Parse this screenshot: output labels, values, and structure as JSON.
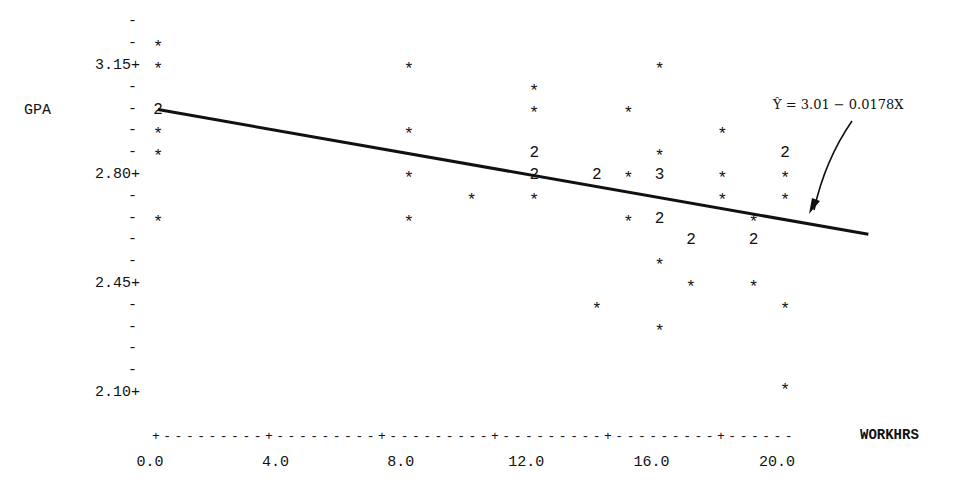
{
  "chart_data": {
    "type": "scatter",
    "title": "",
    "xlabel": "WORKHRS",
    "ylabel": "GPA",
    "x_ticks": [
      "0.0",
      "4.0",
      "8.0",
      "12.0",
      "16.0",
      "20.0"
    ],
    "y_ticks": [
      "3.15+",
      "2.80+",
      "2.45+",
      "2.10+"
    ],
    "xlim": [
      0,
      22.5
    ],
    "ylim": [
      2.03,
      3.29
    ],
    "grid": false,
    "legend": null,
    "marker_note": "* = 1 observation, digit = number of coincident observations",
    "regression_line": {
      "label": "Ŷ = 3.01 − 0.0178X",
      "intercept": 3.01,
      "slope": -0.0178,
      "x_range": [
        0,
        22.5
      ]
    },
    "points": [
      {
        "x": 0,
        "y": 3.22,
        "count": 1,
        "mark": "*"
      },
      {
        "x": 0,
        "y": 3.15,
        "count": 1,
        "mark": "*"
      },
      {
        "x": 0,
        "y": 3.01,
        "count": 2,
        "mark": "2"
      },
      {
        "x": 0,
        "y": 2.94,
        "count": 1,
        "mark": "*"
      },
      {
        "x": 0,
        "y": 2.87,
        "count": 1,
        "mark": "*"
      },
      {
        "x": 0,
        "y": 2.66,
        "count": 1,
        "mark": "*"
      },
      {
        "x": 8,
        "y": 3.15,
        "count": 1,
        "mark": "*"
      },
      {
        "x": 8,
        "y": 2.94,
        "count": 1,
        "mark": "*"
      },
      {
        "x": 8,
        "y": 2.8,
        "count": 1,
        "mark": "*"
      },
      {
        "x": 8,
        "y": 2.66,
        "count": 1,
        "mark": "*"
      },
      {
        "x": 10,
        "y": 2.73,
        "count": 1,
        "mark": "*"
      },
      {
        "x": 12,
        "y": 3.08,
        "count": 1,
        "mark": "*"
      },
      {
        "x": 12,
        "y": 3.01,
        "count": 1,
        "mark": "*"
      },
      {
        "x": 12,
        "y": 2.87,
        "count": 2,
        "mark": "2"
      },
      {
        "x": 12,
        "y": 2.8,
        "count": 2,
        "mark": "2"
      },
      {
        "x": 12,
        "y": 2.73,
        "count": 1,
        "mark": "*"
      },
      {
        "x": 14,
        "y": 2.8,
        "count": 2,
        "mark": "2"
      },
      {
        "x": 14,
        "y": 2.38,
        "count": 1,
        "mark": "*"
      },
      {
        "x": 15,
        "y": 3.01,
        "count": 1,
        "mark": "*"
      },
      {
        "x": 15,
        "y": 2.8,
        "count": 1,
        "mark": "*"
      },
      {
        "x": 15,
        "y": 2.66,
        "count": 1,
        "mark": "*"
      },
      {
        "x": 16,
        "y": 3.15,
        "count": 1,
        "mark": "*"
      },
      {
        "x": 16,
        "y": 2.87,
        "count": 1,
        "mark": "*"
      },
      {
        "x": 16,
        "y": 2.8,
        "count": 3,
        "mark": "3"
      },
      {
        "x": 16,
        "y": 2.66,
        "count": 2,
        "mark": "2"
      },
      {
        "x": 16,
        "y": 2.52,
        "count": 1,
        "mark": "*"
      },
      {
        "x": 16,
        "y": 2.31,
        "count": 1,
        "mark": "*"
      },
      {
        "x": 17,
        "y": 2.59,
        "count": 2,
        "mark": "2"
      },
      {
        "x": 17,
        "y": 2.45,
        "count": 1,
        "mark": "*"
      },
      {
        "x": 18,
        "y": 2.94,
        "count": 1,
        "mark": "*"
      },
      {
        "x": 18,
        "y": 2.8,
        "count": 1,
        "mark": "*"
      },
      {
        "x": 18,
        "y": 2.73,
        "count": 1,
        "mark": "*"
      },
      {
        "x": 19,
        "y": 2.66,
        "count": 1,
        "mark": "*"
      },
      {
        "x": 19,
        "y": 2.59,
        "count": 2,
        "mark": "2"
      },
      {
        "x": 19,
        "y": 2.45,
        "count": 1,
        "mark": "*"
      },
      {
        "x": 20,
        "y": 2.87,
        "count": 2,
        "mark": "2"
      },
      {
        "x": 20,
        "y": 2.8,
        "count": 1,
        "mark": "*"
      },
      {
        "x": 20,
        "y": 2.73,
        "count": 1,
        "mark": "*"
      },
      {
        "x": 20,
        "y": 2.38,
        "count": 1,
        "mark": "*"
      },
      {
        "x": 20,
        "y": 2.12,
        "count": 1,
        "mark": "*"
      }
    ]
  },
  "labels": {
    "y_axis_title": "GPA",
    "x_axis_title": "WORKHRS",
    "equation": "Ŷ = 3.01 − 0.0178X",
    "x_axis_line": "+---------+---------+---------+---------+---------+------"
  }
}
